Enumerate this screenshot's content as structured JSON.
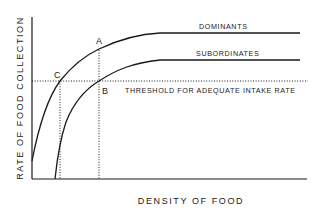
{
  "diagram": {
    "axes": {
      "y_label": "RATE OF FOOD COLLECTION",
      "x_label": "DENSITY OF FOOD"
    },
    "curves": [
      {
        "name": "dominants",
        "label": "DOMINANTS"
      },
      {
        "name": "subordinates",
        "label": "SUBORDINATES"
      }
    ],
    "threshold": {
      "label": "THRESHOLD FOR ADEQUATE INTAKE RATE"
    },
    "points": {
      "a": "A",
      "b": "B",
      "c": "C"
    },
    "colors": {
      "ink": "#1a1a1a",
      "background": "#ffffff"
    }
  }
}
